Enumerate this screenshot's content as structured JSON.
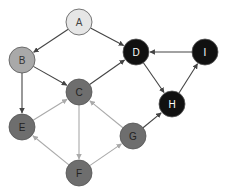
{
  "diagram": {
    "type": "directed-graph",
    "nodes": [
      {
        "id": "A",
        "label": "A",
        "x": 79,
        "y": 22,
        "fill": "#e6e6e6",
        "text": "#444444"
      },
      {
        "id": "B",
        "label": "B",
        "x": 22,
        "y": 60,
        "fill": "#a9a9a9",
        "text": "#333333"
      },
      {
        "id": "C",
        "label": "C",
        "x": 79,
        "y": 92,
        "fill": "#6e6e6e",
        "text": "#222222"
      },
      {
        "id": "D",
        "label": "D",
        "x": 136,
        "y": 52,
        "fill": "#111111",
        "text": "#ffffff"
      },
      {
        "id": "I",
        "label": "I",
        "x": 205,
        "y": 52,
        "fill": "#111111",
        "text": "#ffffff"
      },
      {
        "id": "H",
        "label": "H",
        "x": 172,
        "y": 104,
        "fill": "#111111",
        "text": "#ffffff"
      },
      {
        "id": "E",
        "label": "E",
        "x": 22,
        "y": 127,
        "fill": "#6e6e6e",
        "text": "#222222"
      },
      {
        "id": "G",
        "label": "G",
        "x": 133,
        "y": 136,
        "fill": "#6e6e6e",
        "text": "#222222"
      },
      {
        "id": "F",
        "label": "F",
        "x": 79,
        "y": 173,
        "fill": "#6e6e6e",
        "text": "#222222"
      }
    ],
    "edges": [
      {
        "from": "A",
        "to": "B",
        "color": "#444444"
      },
      {
        "from": "A",
        "to": "D",
        "color": "#444444"
      },
      {
        "from": "B",
        "to": "C",
        "color": "#444444"
      },
      {
        "from": "B",
        "to": "E",
        "color": "#444444"
      },
      {
        "from": "C",
        "to": "D",
        "color": "#444444"
      },
      {
        "from": "D",
        "to": "H",
        "color": "#444444"
      },
      {
        "from": "H",
        "to": "I",
        "color": "#444444"
      },
      {
        "from": "I",
        "to": "D",
        "color": "#444444"
      },
      {
        "from": "G",
        "to": "H",
        "color": "#444444"
      },
      {
        "from": "E",
        "to": "C",
        "color": "#aaaaaa"
      },
      {
        "from": "C",
        "to": "F",
        "color": "#aaaaaa"
      },
      {
        "from": "F",
        "to": "E",
        "color": "#aaaaaa"
      },
      {
        "from": "F",
        "to": "G",
        "color": "#aaaaaa"
      },
      {
        "from": "G",
        "to": "C",
        "color": "#aaaaaa"
      }
    ],
    "node_radius": 13,
    "stroke": "#555555"
  }
}
